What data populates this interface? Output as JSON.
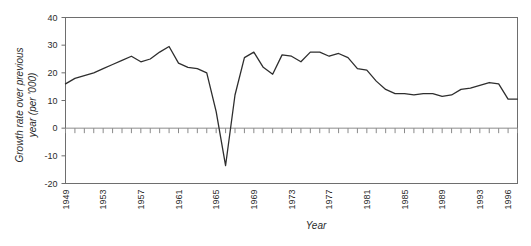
{
  "chart_data": {
    "type": "line",
    "title": "",
    "xlabel": "Year",
    "ylabel": "Growth rate over previous year (per '000)",
    "ylabel_line1": "Growth rate over previous",
    "ylabel_line2": "year (per '000)",
    "ylim": [
      -20,
      40
    ],
    "yticks": [
      -20,
      -10,
      0,
      10,
      20,
      30,
      40
    ],
    "ytick_labels": [
      "-20",
      "-10",
      "0",
      "10",
      "20",
      "30",
      "40"
    ],
    "xlim": [
      1949,
      1997
    ],
    "xtick_labels": [
      "1949",
      "1953",
      "1957",
      "1961",
      "1965",
      "1969",
      "1973",
      "1977",
      "1981",
      "1985",
      "1989",
      "1993",
      "1996"
    ],
    "xtick_years": [
      1949,
      1953,
      1957,
      1961,
      1965,
      1969,
      1973,
      1977,
      1981,
      1985,
      1989,
      1993,
      1996
    ],
    "grid": false,
    "legend": false,
    "line_color": "#2e2e2e",
    "frame_color": "#6e6e6e",
    "x": [
      1949,
      1950,
      1951,
      1952,
      1953,
      1954,
      1955,
      1956,
      1957,
      1958,
      1959,
      1960,
      1961,
      1962,
      1963,
      1964,
      1965,
      1966,
      1967,
      1968,
      1969,
      1970,
      1971,
      1972,
      1973,
      1974,
      1975,
      1976,
      1977,
      1978,
      1979,
      1980,
      1981,
      1982,
      1983,
      1984,
      1985,
      1986,
      1987,
      1988,
      1989,
      1990,
      1991,
      1992,
      1993,
      1994,
      1995,
      1996,
      1997
    ],
    "values": [
      16.0,
      18.5,
      19.5,
      21.0,
      22.5,
      24.0,
      25.5,
      27.0,
      25.5,
      24.0,
      26.5,
      29.5,
      26.0,
      24.0,
      23.5,
      22.0,
      16.0,
      -13.5,
      -6.0,
      13.0,
      26.5,
      28.0,
      24.5,
      21.5,
      27.0,
      26.5,
      25.0,
      27.5,
      28.0,
      26.5,
      27.0,
      25.5,
      21.5,
      21.0,
      17.0,
      14.0,
      12.5,
      12.5,
      12.0,
      12.5,
      12.5,
      11.5,
      12.0,
      14.0,
      14.0,
      13.5,
      15.5,
      16.5,
      16.0
    ],
    "series": [
      {
        "name": "Growth rate",
        "points": [
          {
            "year": 1949,
            "value": 16.0
          },
          {
            "year": 1950,
            "value": 18.0
          },
          {
            "year": 1951,
            "value": 19.0
          },
          {
            "year": 1952,
            "value": 20.0
          },
          {
            "year": 1953,
            "value": 21.5
          },
          {
            "year": 1954,
            "value": 23.0
          },
          {
            "year": 1955,
            "value": 24.5
          },
          {
            "year": 1956,
            "value": 26.0
          },
          {
            "year": 1957,
            "value": 24.0
          },
          {
            "year": 1958,
            "value": 25.0
          },
          {
            "year": 1959,
            "value": 27.5
          },
          {
            "year": 1960,
            "value": 29.5
          },
          {
            "year": 1961,
            "value": 23.5
          },
          {
            "year": 1962,
            "value": 22.0
          },
          {
            "year": 1963,
            "value": 21.5
          },
          {
            "year": 1964,
            "value": 20.0
          },
          {
            "year": 1965,
            "value": 6.0
          },
          {
            "year": 1966,
            "value": -13.5
          },
          {
            "year": 1967,
            "value": 12.0
          },
          {
            "year": 1968,
            "value": 25.5
          },
          {
            "year": 1969,
            "value": 27.5
          },
          {
            "year": 1970,
            "value": 22.0
          },
          {
            "year": 1971,
            "value": 19.5
          },
          {
            "year": 1972,
            "value": 26.5
          },
          {
            "year": 1973,
            "value": 26.0
          },
          {
            "year": 1974,
            "value": 24.0
          },
          {
            "year": 1975,
            "value": 27.5
          },
          {
            "year": 1976,
            "value": 27.5
          },
          {
            "year": 1977,
            "value": 26.0
          },
          {
            "year": 1978,
            "value": 27.0
          },
          {
            "year": 1979,
            "value": 25.5
          },
          {
            "year": 1980,
            "value": 21.5
          },
          {
            "year": 1981,
            "value": 21.0
          },
          {
            "year": 1982,
            "value": 17.0
          },
          {
            "year": 1983,
            "value": 14.0
          },
          {
            "year": 1984,
            "value": 12.5
          },
          {
            "year": 1985,
            "value": 12.5
          },
          {
            "year": 1986,
            "value": 12.0
          },
          {
            "year": 1987,
            "value": 12.5
          },
          {
            "year": 1988,
            "value": 12.5
          },
          {
            "year": 1989,
            "value": 11.5
          },
          {
            "year": 1990,
            "value": 12.0
          },
          {
            "year": 1991,
            "value": 14.0
          },
          {
            "year": 1992,
            "value": 14.5
          },
          {
            "year": 1993,
            "value": 15.5
          },
          {
            "year": 1994,
            "value": 16.5
          },
          {
            "year": 1995,
            "value": 16.0
          },
          {
            "year": 1996,
            "value": 10.5
          },
          {
            "year": 1997,
            "value": 10.5
          }
        ]
      }
    ]
  }
}
